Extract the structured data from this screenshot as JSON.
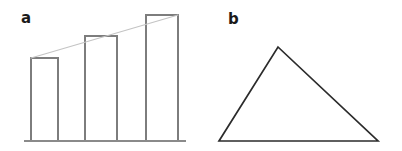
{
  "figure": {
    "width": 402,
    "height": 151,
    "background_color": "#ffffff"
  },
  "panels": {
    "a": {
      "label": "a",
      "label_position": {
        "x": 21,
        "y": 11
      },
      "type": "bar-with-trendline",
      "baseline": {
        "x1": 24,
        "x2": 186,
        "y": 141,
        "color": "#8a8a8a",
        "width": 1.6
      },
      "bar_stroke_color": "#7d7d7d",
      "bar_fill_color": "#ffffff",
      "bar_stroke_width": 1.4,
      "bars": [
        {
          "name": "bar-1",
          "x": 31,
          "width": 27,
          "top": 58,
          "bottom": 141
        },
        {
          "name": "bar-2",
          "x": 85,
          "width": 32,
          "top": 36,
          "bottom": 141
        },
        {
          "name": "bar-3",
          "x": 146,
          "width": 32,
          "top": 15,
          "bottom": 141
        }
      ],
      "trendline": {
        "name": "trend-line",
        "color": "#c4c4c4",
        "width": 1.2,
        "x1": 31,
        "y1": 58,
        "x2": 178,
        "y2": 15
      }
    },
    "b": {
      "label": "b",
      "label_position": {
        "x": 27,
        "y": 12
      },
      "type": "triangle",
      "stroke_color": "#2b2b2b",
      "stroke_width": 1.7,
      "fill_color": "none",
      "vertices": [
        {
          "name": "apex",
          "x": 77,
          "y": 47
        },
        {
          "name": "bottom-right",
          "x": 177,
          "y": 141
        },
        {
          "name": "bottom-left",
          "x": 18,
          "y": 141
        }
      ]
    }
  },
  "chart_data": {
    "type": "bar",
    "title": "",
    "xlabel": "",
    "ylabel": "",
    "categories": [
      "1",
      "2",
      "3"
    ],
    "values": [
      83,
      105,
      126
    ],
    "ylim": [
      0,
      130
    ],
    "grid": false,
    "legend": null,
    "annotations": [
      "a",
      "b"
    ],
    "series": [
      {
        "name": "bars",
        "values": [
          83,
          105,
          126
        ]
      },
      {
        "name": "trend",
        "values": [
          83,
          105,
          126
        ]
      }
    ]
  }
}
